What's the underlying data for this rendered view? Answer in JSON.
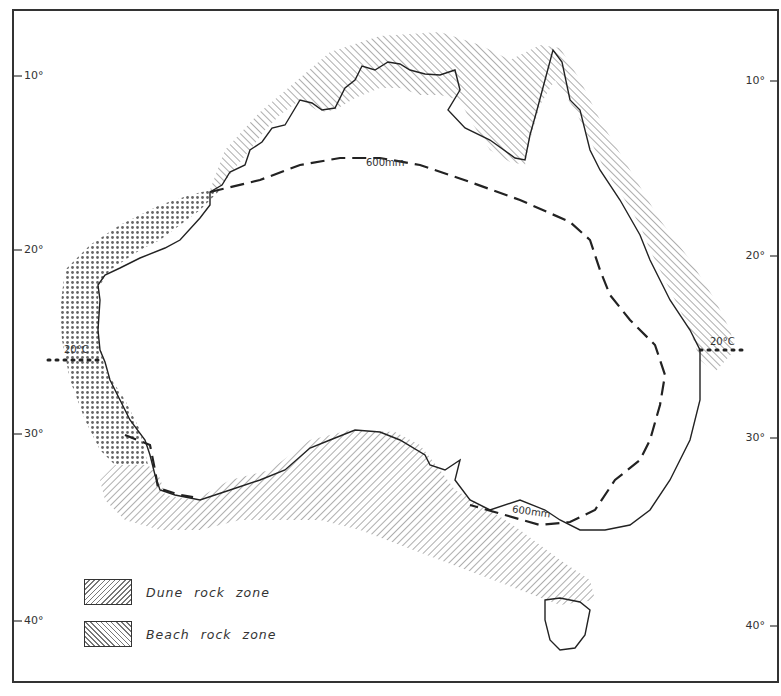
{
  "map": {
    "frame": {
      "x": 13,
      "y": 10,
      "width": 765,
      "height": 672,
      "stroke": "#333333"
    },
    "latitude_ticks": {
      "left": [
        {
          "label": "10°",
          "y": 76
        },
        {
          "label": "20°",
          "y": 250
        },
        {
          "label": "30°",
          "y": 434
        },
        {
          "label": "40°",
          "y": 621
        }
      ],
      "right": [
        {
          "label": "10°",
          "y": 81
        },
        {
          "label": "20°",
          "y": 256
        },
        {
          "label": "30°",
          "y": 438
        },
        {
          "label": "40°",
          "y": 626
        }
      ]
    },
    "isohyet": {
      "label": "600mm",
      "style": "dashed",
      "labels": [
        {
          "text": "600mm",
          "x": 366,
          "y": 158
        },
        {
          "text": "600mm",
          "x": 512,
          "y": 507
        }
      ]
    },
    "isotherm": {
      "label": "20°C",
      "style": "dotted",
      "labels": [
        {
          "text": "20°C",
          "x": 64,
          "y": 345,
          "side": "west"
        },
        {
          "text": "20°C",
          "x": 710,
          "y": 337,
          "side": "east"
        }
      ]
    },
    "colors": {
      "line": "#333333",
      "hatch": "#777777",
      "background": "#ffffff"
    }
  },
  "legend": {
    "items": [
      {
        "label": "Dune rock zone",
        "pattern": "forward-hatch"
      },
      {
        "label": "Beach rock zone",
        "pattern": "back-hatch"
      }
    ]
  }
}
